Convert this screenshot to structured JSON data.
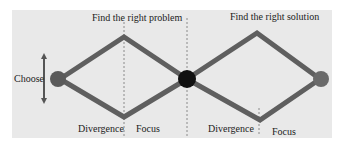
{
  "diagram": {
    "title_left": "Find the right problem",
    "title_right": "Find the right solution",
    "choose_label": "Choose",
    "left_bottom": {
      "divergence": "Divergence",
      "focus": "Focus"
    },
    "right_bottom": {
      "divergence": "Divergence",
      "focus": "Focus"
    },
    "colors": {
      "background": "#e9e9e9",
      "line": "#5f5f5f",
      "start_node": "#5a5a5a",
      "middle_node": "#111111",
      "end_node": "#6a6a6a",
      "divider": "#8a8a8a"
    }
  }
}
